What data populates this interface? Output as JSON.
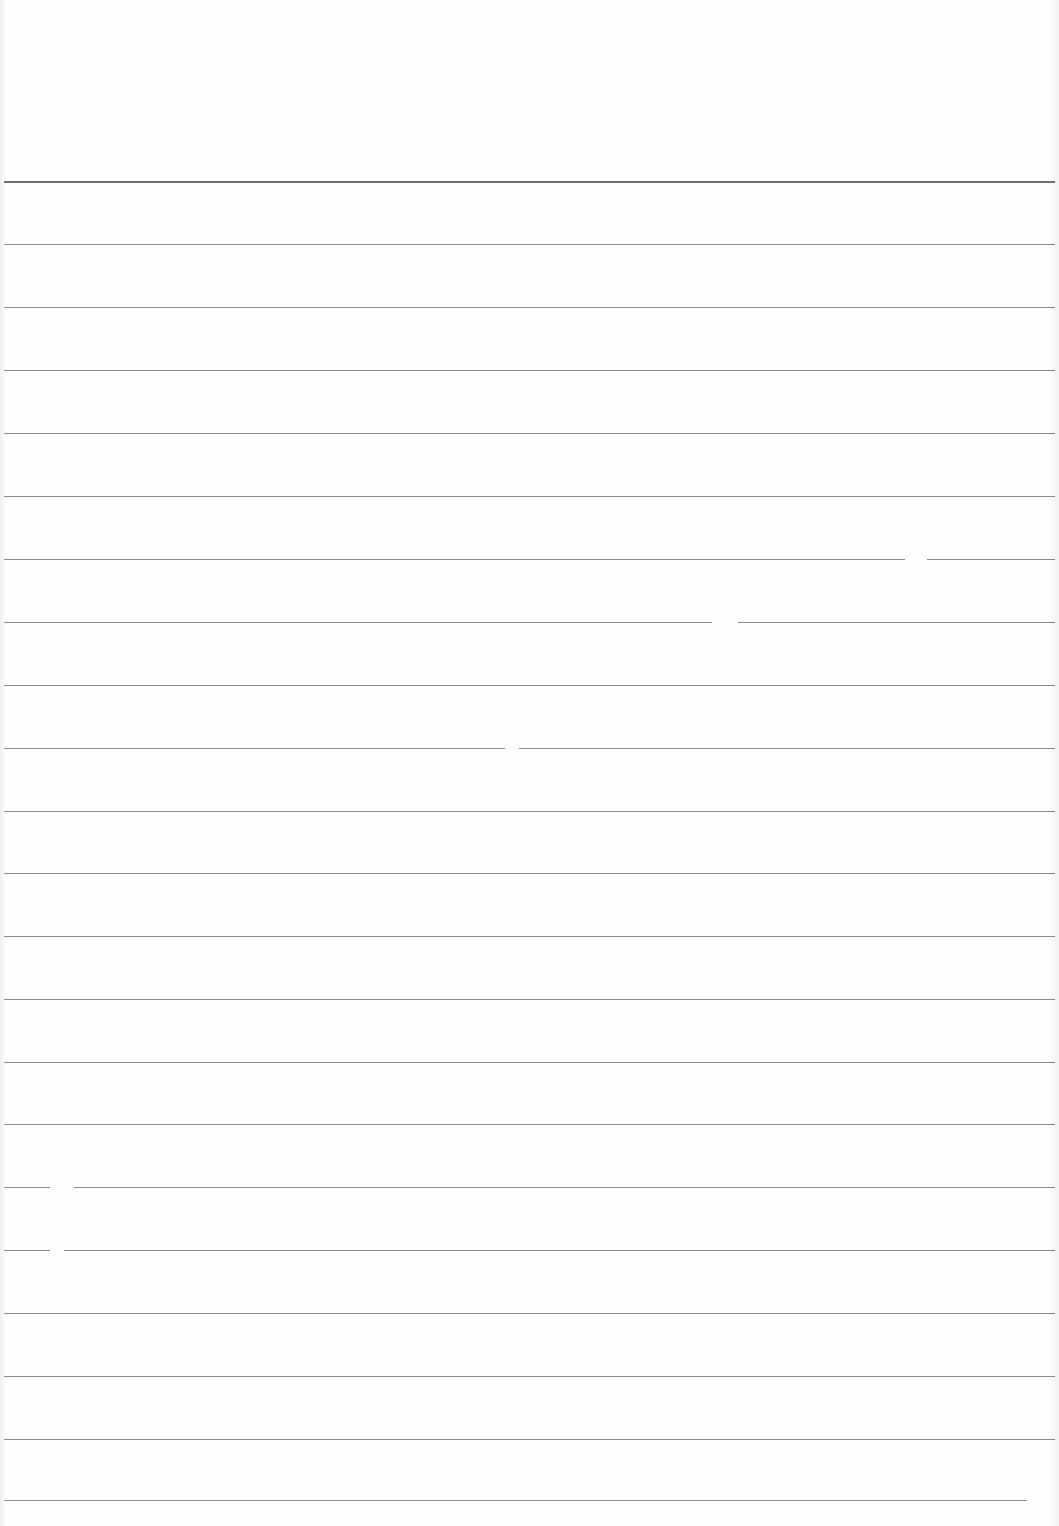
{
  "sheet": {
    "type": "lined-paper",
    "background_color": "#fefefe",
    "line_color": "#8a8a8a",
    "top_line_color": "#6f6f6f",
    "line_count": 22,
    "line_spacing_px": 63,
    "lines_y": [
      181,
      244,
      307,
      370,
      433,
      496,
      559,
      622,
      685,
      748,
      811,
      873,
      936,
      999,
      1062,
      1124,
      1187,
      1250,
      1313,
      1376,
      1439,
      1500
    ],
    "text": ""
  }
}
